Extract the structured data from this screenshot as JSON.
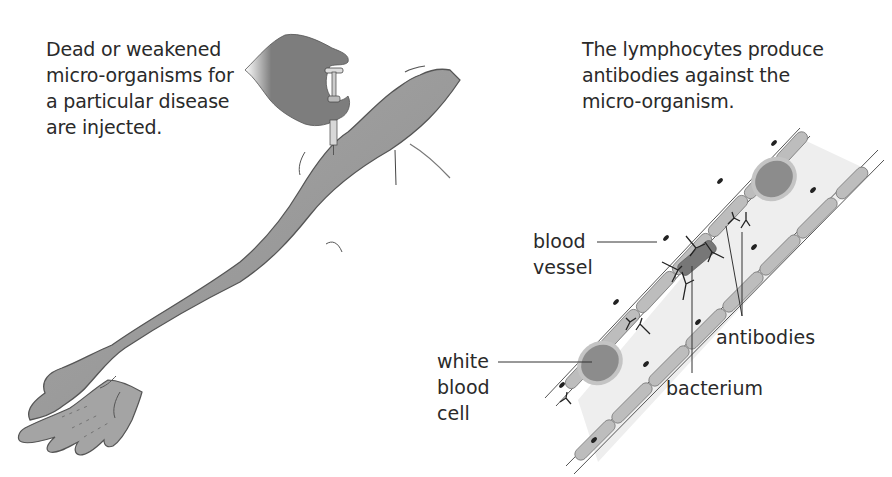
{
  "captions": {
    "left": {
      "lines": [
        "Dead or weakened",
        "micro-organisms for",
        "a particular disease",
        "are injected."
      ]
    },
    "right": {
      "lines": [
        "The lymphocytes produce",
        "antibodies against the",
        "micro-organism."
      ]
    }
  },
  "labels": {
    "blood_vessel": {
      "lines": [
        "blood",
        "vessel"
      ]
    },
    "white_blood_cell": {
      "lines": [
        "white",
        "blood",
        "cell"
      ]
    },
    "antibodies": {
      "lines": [
        "antibodies"
      ]
    },
    "bacterium": {
      "lines": [
        "bacterium"
      ]
    }
  },
  "colors": {
    "skin": "#9a9a9a",
    "skin_outline": "#555555",
    "hand": "#7a7a7a",
    "vessel_wall": "#b8b8b8",
    "vessel_lumen": "#efefef",
    "cell_body": "#8c8c8c",
    "cell_membrane": "#bdbdbd",
    "bacterium": "#777777",
    "text": "#2a2a2a",
    "leader_line": "#333333"
  }
}
